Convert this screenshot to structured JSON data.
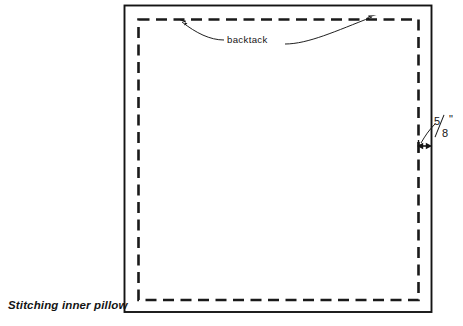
{
  "figure": {
    "caption": "Stitching inner pillow",
    "annotations": {
      "backtack_label": "backtack",
      "seam_allowance": {
        "numerator": "5",
        "denominator": "8",
        "unit_mark": "\"",
        "full_text": "5/8\""
      }
    },
    "colors": {
      "ink": "#141414",
      "background": "#ffffff"
    },
    "geometry": {
      "fabric_outline": {
        "x": 124,
        "y": 5,
        "width": 307,
        "height": 307,
        "style": "solid"
      },
      "stitch_line": {
        "x": 138,
        "y": 19,
        "width": 280,
        "height": 281,
        "style": "dashed"
      },
      "dimension_y": 146
    }
  }
}
